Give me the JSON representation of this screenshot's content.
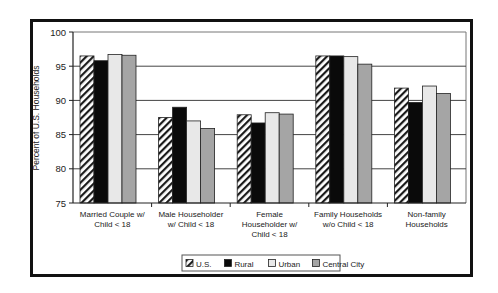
{
  "chart_data": {
    "type": "bar",
    "title": "",
    "xlabel": "",
    "ylabel": "Percent of U.S. Households",
    "ylim": [
      75,
      100
    ],
    "yticks": [
      75,
      80,
      85,
      90,
      95,
      100
    ],
    "grid": true,
    "legend_position": "bottom",
    "categories": [
      [
        "Married Couple w/",
        "Child < 18"
      ],
      [
        "Male Householder",
        "w/ Child < 18"
      ],
      [
        "Female",
        "Householder w/",
        "Child < 18"
      ],
      [
        "Family Households",
        "w/o Child < 18"
      ],
      [
        "Non-family",
        "Households"
      ]
    ],
    "series": [
      {
        "name": "U.S.",
        "pattern": "hatch",
        "color": "#ffffff",
        "values": [
          96.5,
          87.5,
          87.9,
          96.5,
          91.8
        ]
      },
      {
        "name": "Rural",
        "pattern": "solid",
        "color": "#0a0a0a",
        "values": [
          95.8,
          89.0,
          86.7,
          96.5,
          89.7
        ]
      },
      {
        "name": "Urban",
        "pattern": "solid",
        "color": "#e8e8e8",
        "values": [
          96.7,
          87.0,
          88.2,
          96.4,
          92.1
        ]
      },
      {
        "name": "Central City",
        "pattern": "solid",
        "color": "#a5a5a5",
        "values": [
          96.6,
          85.9,
          88.0,
          95.3,
          91.0
        ]
      }
    ]
  }
}
